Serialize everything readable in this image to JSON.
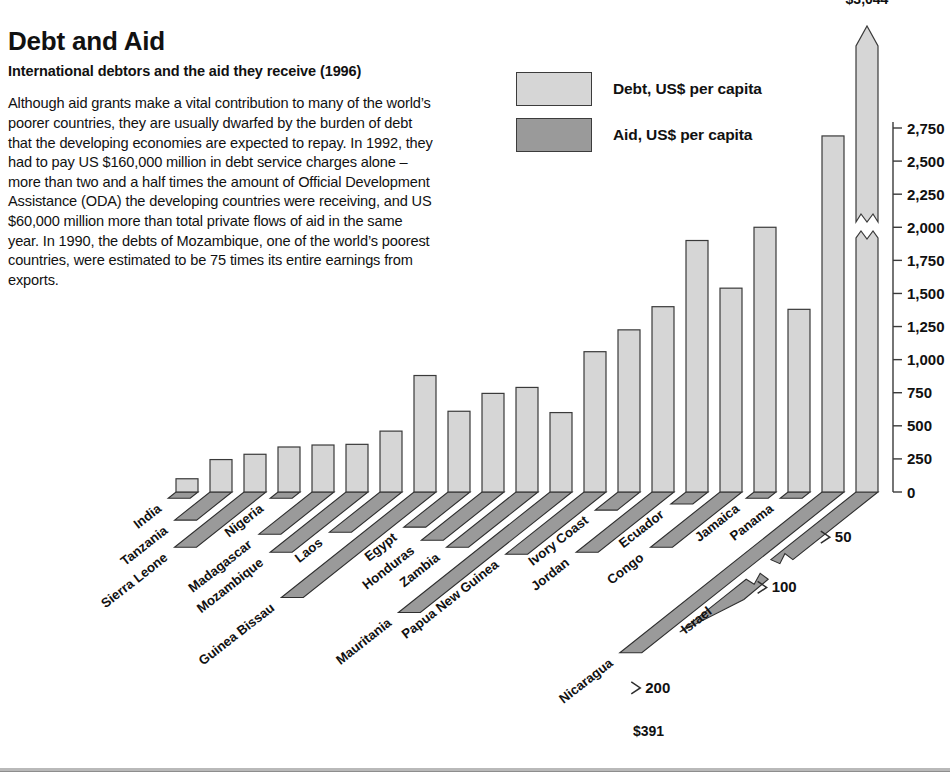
{
  "article": {
    "title": "Debt and Aid",
    "subtitle": "International debtors and the aid they receive (1996)",
    "body": "Although aid grants make a vital contribution to many of the world’s poorer countries, they are usually dwarfed by the burden of debt that the developing economies are expected to repay. In 1992, they had to pay US $160,000 million in debt service charges alone – more than two and a half times the amount of Official Development Assistance (ODA) the developing countries were receiving, and US $60,000 million more than total private flows of aid in the same year. In 1990, the debts of Mozambique, one of the world’s poorest countries, were estimated to be 75 times its entire earnings from exports."
  },
  "legend": {
    "position": "top-center",
    "items": [
      {
        "label": "Debt, US$ per capita",
        "color": "#d6d6d6",
        "key": "debt"
      },
      {
        "label": "Aid, US$ per capita",
        "color": "#9a9a9a",
        "key": "aid"
      }
    ]
  },
  "chart_data": {
    "type": "bar",
    "title": "International debtors and the aid they receive (1996)",
    "xlabel": "",
    "ylabel": "US$ per capita",
    "grid": false,
    "projection": "3d-oblique",
    "categories": [
      "India",
      "Tanzania",
      "Sierra Leone",
      "Nigeria",
      "Madagascar",
      "Mozambique",
      "Laos",
      "Guinea Bissau",
      "Egypt",
      "Honduras",
      "Zambia",
      "Mauritania",
      "Papua New Guinea",
      "Ivory Coast",
      "Jordan",
      "Ecuador",
      "Congo",
      "Jamaica",
      "Panama",
      "Nicaragua",
      "Israel"
    ],
    "series": [
      {
        "name": "Debt, US$ per capita",
        "color": "#d6d6d6",
        "axis": "left-vertical",
        "values": [
          100,
          245,
          285,
          340,
          355,
          360,
          460,
          880,
          610,
          745,
          790,
          600,
          1060,
          1225,
          1400,
          1900,
          1540,
          2000,
          1380,
          2690,
          3044
        ],
        "off_scale": [
          {
            "category": "Israel",
            "label": "$3,044",
            "broken_axis": true,
            "arrow": true
          }
        ]
      },
      {
        "name": "Aid, US$ per capita",
        "color": "#9a9a9a",
        "axis": "depth-diagonal",
        "values": [
          2,
          28,
          55,
          2,
          42,
          60,
          40,
          105,
          35,
          48,
          55,
          120,
          62,
          18,
          60,
          12,
          55,
          6,
          4,
          160,
          391
        ],
        "off_scale": [
          {
            "category": "Israel",
            "label": "$391",
            "broken_axis": true,
            "arrow": true
          }
        ]
      }
    ],
    "y_axis": {
      "position": "right",
      "ticks": [
        "0",
        "250",
        "500",
        "750",
        "1,000",
        "1,250",
        "1,500",
        "1,750",
        "2,000",
        "2,250",
        "2,500",
        "2,750"
      ],
      "range": [
        0,
        2750
      ],
      "step": 250
    },
    "depth_axis": {
      "title": "",
      "ticks": [
        "50",
        "100",
        "200"
      ],
      "range": [
        0,
        200
      ]
    },
    "annotations": [
      {
        "text": "$3,044",
        "target": "Israel debt bar top",
        "position": "top"
      },
      {
        "text": "$391",
        "target": "Israel aid bar tip",
        "position": "bottom"
      }
    ]
  }
}
